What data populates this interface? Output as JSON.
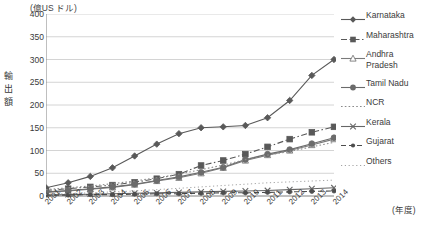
{
  "chart_data": {
    "type": "line",
    "title": "",
    "unit_note": "(億US ドル)",
    "ylabel": "輸出額",
    "xlabel": "(年度)",
    "grid": true,
    "legend_position": "right",
    "ylim": [
      0,
      400
    ],
    "yticks": [
      0,
      50,
      100,
      150,
      200,
      250,
      300,
      350,
      400
    ],
    "categories": [
      "2001",
      "2002",
      "2003",
      "2004",
      "2005",
      "2006",
      "2007",
      "2008",
      "2009",
      "2010",
      "2011",
      "2012",
      "2013",
      "2014"
    ],
    "series": [
      {
        "name": "Karnataka",
        "marker": "diamond-filled",
        "line": "solid",
        "color": "#595959",
        "values": [
          18,
          29,
          43,
          62,
          88,
          114,
          137,
          150,
          152,
          155,
          172,
          210,
          265,
          300
        ]
      },
      {
        "name": "Maharashtra",
        "marker": "square-filled",
        "line": "dash-dot",
        "color": "#595959",
        "values": [
          12,
          16,
          20,
          24,
          30,
          38,
          48,
          67,
          78,
          92,
          108,
          125,
          140,
          152
        ]
      },
      {
        "name": "Andhra Pradesh",
        "marker": "triangle-open",
        "line": "solid",
        "color": "#7a7a7a",
        "values": [
          8,
          11,
          15,
          19,
          25,
          33,
          40,
          50,
          62,
          78,
          90,
          100,
          112,
          125
        ]
      },
      {
        "name": "Tamil Nadu",
        "marker": "circle-filled",
        "line": "solid",
        "color": "#6b6b6b",
        "values": [
          9,
          12,
          16,
          20,
          26,
          34,
          42,
          52,
          63,
          80,
          92,
          102,
          115,
          128
        ]
      },
      {
        "name": "NCR",
        "marker": "none",
        "line": "dotted",
        "color": "#8a8a8a",
        "values": [
          14,
          18,
          22,
          27,
          33,
          40,
          48,
          58,
          68,
          80,
          90,
          98,
          108,
          118
        ]
      },
      {
        "name": "Kerala",
        "marker": "x",
        "line": "solid",
        "color": "#666666",
        "values": [
          2,
          3,
          4,
          5,
          6,
          7,
          8,
          9,
          10,
          11,
          12,
          14,
          16,
          18
        ]
      },
      {
        "name": "Gujarat",
        "marker": "circle-small-filled",
        "line": "dashed",
        "color": "#4d4d4d",
        "values": [
          2,
          2,
          3,
          3,
          4,
          5,
          5,
          6,
          7,
          7,
          8,
          9,
          10,
          11
        ]
      },
      {
        "name": "Others",
        "marker": "none",
        "line": "fine-dotted",
        "color": "#9a9a9a",
        "values": [
          4,
          5,
          7,
          9,
          11,
          14,
          17,
          20,
          23,
          26,
          29,
          31,
          33,
          35
        ]
      }
    ]
  },
  "axis": {
    "unit_note": "(億US ドル)",
    "ylabel_chars": [
      "輸",
      "出",
      "額"
    ],
    "xaxis_title": "(年度)",
    "yticks": [
      "400",
      "350",
      "300",
      "250",
      "200",
      "150",
      "100",
      "50",
      "0"
    ],
    "xticks": [
      "2001",
      "2002",
      "2003",
      "2004",
      "2005",
      "2006",
      "2007",
      "2008",
      "2009",
      "2010",
      "2011",
      "2012",
      "2013",
      "2014"
    ]
  },
  "legend": {
    "items": [
      {
        "label": "Karnataka"
      },
      {
        "label": "Maharashtra"
      },
      {
        "label": "Andhra\nPradesh"
      },
      {
        "label": "Tamil Nadu"
      },
      {
        "label": "NCR"
      },
      {
        "label": "Kerala"
      },
      {
        "label": "Gujarat"
      },
      {
        "label": "Others"
      }
    ]
  }
}
